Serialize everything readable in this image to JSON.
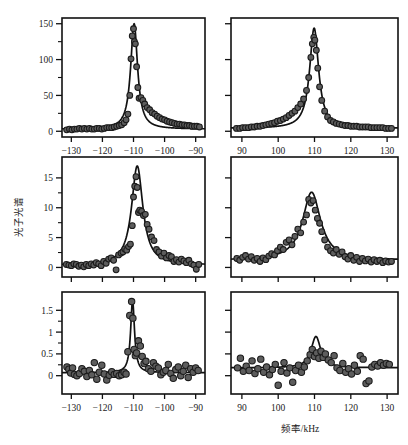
{
  "figure": {
    "title": "",
    "xlabel": "频率/kHz",
    "ylabel": "光子光谱"
  },
  "chart_data": [
    {
      "type": "scatter",
      "panel": "top-left",
      "row": 1,
      "column": 1,
      "title": "",
      "xlabel": "频率/kHz",
      "ylabel": "光子光谱",
      "xlim": [
        -133,
        -87
      ],
      "ylim": [
        -8,
        158
      ],
      "xticks": [
        -130,
        -120,
        -110,
        -100,
        -90
      ],
      "xticklabels": [
        "−130",
        "−120",
        "−110",
        "−100",
        "−90"
      ],
      "yticks": [
        0,
        50,
        100,
        150
      ],
      "yticklabels": [
        "0",
        "50",
        "100",
        "150"
      ],
      "yminorticks": [
        25,
        75,
        125
      ],
      "grid": false,
      "legend": null,
      "series": [
        {
          "name": "data",
          "marker": "filled-circle",
          "color": "#5d5d5d",
          "x": [
            -131.5,
            -130.6,
            -129.8,
            -129.0,
            -128.2,
            -127.4,
            -126.6,
            -125.8,
            -125.0,
            -124.2,
            -123.4,
            -122.6,
            -121.8,
            -121.0,
            -120.2,
            -119.4,
            -118.6,
            -117.8,
            -117.0,
            -116.2,
            -115.4,
            -114.6,
            -113.8,
            -113.0,
            -112.4,
            -111.8,
            -111.2,
            -110.8,
            -110.4,
            -110.0,
            -109.7,
            -109.4,
            -109.0,
            -108.6,
            -108.2,
            -107.6,
            -107.0,
            -106.4,
            -105.6,
            -104.8,
            -104.0,
            -103.2,
            -102.4,
            -101.6,
            -100.8,
            -100.0,
            -99.2,
            -98.4,
            -97.6,
            -96.8,
            -96.0,
            -95.2,
            -94.4,
            -93.6,
            -92.8,
            -92.0,
            -91.2,
            -90.4,
            -89.6,
            -88.8
          ],
          "y": [
            2,
            3,
            2,
            3,
            3,
            4,
            3,
            4,
            3,
            4,
            3,
            3,
            4,
            4,
            3,
            4,
            5,
            5,
            5,
            6,
            7,
            8,
            9,
            12,
            16,
            24,
            50,
            101,
            133,
            143,
            125,
            122,
            90,
            61,
            46,
            47,
            43,
            38,
            33,
            30,
            26,
            24,
            21,
            19,
            17,
            16,
            14,
            13,
            12,
            11,
            10,
            10,
            9,
            9,
            8,
            8,
            7,
            7,
            7,
            6
          ]
        },
        {
          "name": "lorentzian-fit",
          "type": "line",
          "color": "#111111",
          "peak_center": -109.8,
          "peak_height": 147,
          "hwhm": 1.35,
          "baseline": 3.0
        }
      ]
    },
    {
      "type": "scatter",
      "panel": "top-right",
      "row": 1,
      "column": 2,
      "title": "",
      "xlim": [
        87,
        133
      ],
      "ylim": [
        -8,
        158
      ],
      "xticks": [
        90,
        100,
        110,
        120,
        130
      ],
      "xticklabels": [
        "90",
        "100",
        "110",
        "120",
        "130"
      ],
      "yticks": [
        0,
        50,
        100,
        150
      ],
      "grid": false,
      "legend": null,
      "series": [
        {
          "name": "data",
          "marker": "filled-circle",
          "color": "#5d5d5d",
          "x": [
            88.5,
            89.4,
            90.2,
            91.0,
            91.8,
            92.6,
            93.4,
            94.2,
            95.0,
            95.8,
            96.6,
            97.4,
            98.2,
            99.0,
            99.8,
            100.6,
            101.4,
            102.2,
            103.0,
            103.8,
            104.6,
            105.4,
            106.2,
            107.0,
            107.8,
            108.4,
            109.0,
            109.4,
            109.8,
            110.1,
            110.5,
            110.9,
            111.4,
            112.0,
            112.8,
            113.6,
            114.4,
            115.2,
            116.0,
            116.8,
            117.6,
            118.4,
            119.2,
            120.0,
            120.8,
            121.6,
            122.4,
            123.2,
            124.0,
            124.8,
            125.6,
            126.4,
            127.2,
            128.0,
            128.8,
            129.6,
            130.4,
            131.2
          ],
          "y": [
            4,
            4,
            5,
            5,
            5,
            6,
            6,
            7,
            7,
            8,
            9,
            10,
            11,
            12,
            14,
            15,
            17,
            19,
            22,
            25,
            28,
            33,
            38,
            45,
            57,
            75,
            103,
            122,
            131,
            127,
            113,
            88,
            62,
            43,
            28,
            20,
            15,
            13,
            11,
            10,
            9,
            8,
            8,
            7,
            7,
            7,
            6,
            6,
            6,
            6,
            5,
            5,
            5,
            5,
            5,
            4,
            4,
            4
          ]
        },
        {
          "name": "lorentzian-fit",
          "type": "line",
          "color": "#111111",
          "peak_center": 109.9,
          "peak_height": 140,
          "hwhm": 1.5,
          "baseline": 4.0
        }
      ]
    },
    {
      "type": "scatter",
      "panel": "middle-left",
      "row": 2,
      "column": 1,
      "title": "",
      "xlim": [
        -133,
        -87
      ],
      "ylim": [
        -1.6,
        18.5
      ],
      "xticks": [
        -130,
        -120,
        -110,
        -100,
        -90
      ],
      "yticks": [
        0,
        5,
        10,
        15
      ],
      "yticklabels": [
        "0",
        "5",
        "10",
        "15"
      ],
      "yminorticks": [
        2.5,
        7.5,
        12.5
      ],
      "grid": false,
      "legend": null,
      "series": [
        {
          "name": "data",
          "marker": "filled-circle",
          "color": "#5d5d5d",
          "x": [
            -131.6,
            -130.8,
            -130.0,
            -129.2,
            -128.4,
            -127.6,
            -126.8,
            -126.0,
            -125.2,
            -124.4,
            -123.6,
            -122.8,
            -122.0,
            -121.2,
            -120.4,
            -119.6,
            -118.8,
            -118.0,
            -117.2,
            -116.4,
            -115.6,
            -114.8,
            -114.0,
            -113.4,
            -112.8,
            -112.2,
            -111.6,
            -111.0,
            -110.4,
            -110.0,
            -109.6,
            -109.2,
            -108.8,
            -108.4,
            -108.0,
            -107.4,
            -106.8,
            -106.2,
            -105.6,
            -105.0,
            -104.2,
            -103.4,
            -102.6,
            -101.8,
            -101.0,
            -100.2,
            -99.4,
            -98.6,
            -97.8,
            -97.0,
            -96.2,
            -95.4,
            -94.6,
            -93.8,
            -93.0,
            -92.2,
            -91.4,
            -90.6,
            -89.8,
            -89.0
          ],
          "y": [
            0.5,
            0.4,
            0.3,
            0.6,
            0.5,
            0.2,
            0.4,
            0.1,
            0.5,
            0.3,
            0.6,
            0.4,
            0.8,
            0.6,
            0.3,
            1.0,
            0.7,
            1.4,
            1.6,
            1.2,
            -0.4,
            2.1,
            2.4,
            2.6,
            3.1,
            2.9,
            3.5,
            3.9,
            7.0,
            11.8,
            13.6,
            15.2,
            13.4,
            9.2,
            9.6,
            9.4,
            8.7,
            8.9,
            7.2,
            6.4,
            5.1,
            4.5,
            3.0,
            2.6,
            1.9,
            2.4,
            1.6,
            2.0,
            1.8,
            1.0,
            1.3,
            0.9,
            1.4,
            1.1,
            0.8,
            1.2,
            0.6,
            0.4,
            -0.3,
            0.5
          ]
        },
        {
          "name": "lorentzian-fit",
          "type": "line",
          "color": "#111111",
          "peak_center": -108.8,
          "peak_height": 16.6,
          "hwhm": 2.2,
          "baseline": 0.4
        }
      ]
    },
    {
      "type": "scatter",
      "panel": "middle-right",
      "row": 2,
      "column": 2,
      "title": "",
      "xlim": [
        87,
        133
      ],
      "ylim": [
        -1.6,
        18.5
      ],
      "xticks": [
        90,
        100,
        110,
        120,
        130
      ],
      "yticks": [
        0,
        5,
        10,
        15
      ],
      "grid": false,
      "legend": null,
      "series": [
        {
          "name": "data",
          "marker": "filled-circle",
          "color": "#5d5d5d",
          "x": [
            88.6,
            89.4,
            90.2,
            91.0,
            91.8,
            92.6,
            93.4,
            94.2,
            95.0,
            95.8,
            96.6,
            97.4,
            98.2,
            99.0,
            99.8,
            100.6,
            101.4,
            102.2,
            103.0,
            103.8,
            104.6,
            105.4,
            106.2,
            107.0,
            107.8,
            108.4,
            109.0,
            109.6,
            110.2,
            110.8,
            111.4,
            112.0,
            112.8,
            113.6,
            114.4,
            115.2,
            116.0,
            116.8,
            117.6,
            118.4,
            119.2,
            120.0,
            120.8,
            121.6,
            122.4,
            123.2,
            124.0,
            124.8,
            125.6,
            126.4,
            127.2,
            128.0,
            128.8,
            129.6,
            130.4,
            131.2
          ],
          "y": [
            1.5,
            1.2,
            1.7,
            2.0,
            1.4,
            1.8,
            1.2,
            1.5,
            1.0,
            1.6,
            1.3,
            1.9,
            2.3,
            2.1,
            2.8,
            3.4,
            3.0,
            4.2,
            4.6,
            3.8,
            5.2,
            6.4,
            5.8,
            7.6,
            8.8,
            11.4,
            10.8,
            11.2,
            9.6,
            8.2,
            7.4,
            6.0,
            4.6,
            3.4,
            2.8,
            2.4,
            3.0,
            2.2,
            2.6,
            1.8,
            1.4,
            2.0,
            1.2,
            1.7,
            1.0,
            1.5,
            1.1,
            1.4,
            0.9,
            1.3,
            1.0,
            1.2,
            0.8,
            1.1,
            0.9,
            1.0
          ]
        },
        {
          "name": "lorentzian-fit",
          "type": "line",
          "color": "#111111",
          "peak_center": 109.2,
          "peak_height": 11.4,
          "hwhm": 3.0,
          "baseline": 1.2
        }
      ]
    },
    {
      "type": "scatter",
      "panel": "bottom-left",
      "row": 3,
      "column": 1,
      "title": "",
      "xlim": [
        -133,
        -87
      ],
      "ylim": [
        -0.42,
        1.92
      ],
      "xticks": [
        -130,
        -120,
        -110,
        -100,
        -90
      ],
      "xticklabels": [
        "−130",
        "−120",
        "−110",
        "−100",
        "−90"
      ],
      "yticks": [
        0,
        0.5,
        1,
        1.5
      ],
      "yticklabels": [
        "0",
        "0.5",
        "1",
        "1.5"
      ],
      "yminorticks": [
        0.25,
        0.75,
        1.25
      ],
      "grid": false,
      "legend": null,
      "series": [
        {
          "name": "data",
          "marker": "filled-circle",
          "color": "#5d5d5d",
          "x": [
            -131.4,
            -130.8,
            -130.2,
            -129.6,
            -129.0,
            -128.2,
            -127.4,
            -126.6,
            -125.8,
            -125.0,
            -124.2,
            -123.4,
            -122.6,
            -121.8,
            -121.0,
            -120.2,
            -119.4,
            -118.6,
            -117.8,
            -117.0,
            -116.2,
            -115.4,
            -114.6,
            -113.8,
            -113.0,
            -112.4,
            -111.8,
            -111.2,
            -110.6,
            -110.2,
            -109.8,
            -109.4,
            -109.0,
            -108.4,
            -107.8,
            -107.2,
            -106.6,
            -106.0,
            -105.2,
            -104.4,
            -103.6,
            -102.8,
            -102.0,
            -101.2,
            -100.4,
            -99.6,
            -98.8,
            -98.0,
            -97.2,
            -96.4,
            -95.6,
            -94.8,
            -94.0,
            -93.2,
            -92.4,
            -91.6,
            -90.8,
            -90.0,
            -89.2
          ],
          "y": [
            0.2,
            0.15,
            0.06,
            0.18,
            0.03,
            0.0,
            0.05,
            0.16,
            0.1,
            -0.02,
            0.12,
            0.02,
            0.3,
            -0.08,
            0.08,
            0.24,
            0.04,
            -0.1,
            0.01,
            0.09,
            0.03,
            0.05,
            0.0,
            0.02,
            0.08,
            0.04,
            0.55,
            1.38,
            1.7,
            1.32,
            0.6,
            0.46,
            0.52,
            0.8,
            0.68,
            0.44,
            0.28,
            0.33,
            0.16,
            0.1,
            0.3,
            0.22,
            0.18,
            0.02,
            0.08,
            0.12,
            0.26,
            0.05,
            -0.06,
            0.14,
            0.2,
            0.0,
            0.1,
            0.24,
            -0.04,
            0.16,
            0.08,
            0.18,
            0.12
          ]
        },
        {
          "name": "lorentzian-fit",
          "type": "line",
          "color": "#111111",
          "peak_center": -110.3,
          "peak_height": 1.66,
          "hwhm": 0.75,
          "baseline": 0.07
        }
      ]
    },
    {
      "type": "scatter",
      "panel": "bottom-right",
      "row": 3,
      "column": 2,
      "title": "",
      "xlim": [
        87,
        133
      ],
      "ylim": [
        -0.42,
        1.92
      ],
      "xticks": [
        90,
        100,
        110,
        120,
        130
      ],
      "xticklabels": [
        "90",
        "100",
        "110",
        "120",
        "130"
      ],
      "yticks": [
        0,
        0.5,
        1,
        1.5
      ],
      "grid": false,
      "legend": null,
      "series": [
        {
          "name": "data",
          "marker": "filled-circle",
          "color": "#5d5d5d",
          "x": [
            88.8,
            89.6,
            90.4,
            91.2,
            92.0,
            92.8,
            93.6,
            94.4,
            95.2,
            96.0,
            96.8,
            97.6,
            98.4,
            99.2,
            100.0,
            100.8,
            101.6,
            102.4,
            103.2,
            104.0,
            104.8,
            105.6,
            106.4,
            107.2,
            108.0,
            108.8,
            109.4,
            110.0,
            110.6,
            111.2,
            111.8,
            112.4,
            113.0,
            113.8,
            114.6,
            115.4,
            116.2,
            117.0,
            117.8,
            118.6,
            119.4,
            120.2,
            121.0,
            121.8,
            122.6,
            123.4,
            124.2,
            125.0,
            125.8,
            126.6,
            127.4,
            128.2,
            129.0,
            129.8,
            130.6
          ],
          "y": [
            0.18,
            0.4,
            0.1,
            0.22,
            0.12,
            0.34,
            0.05,
            0.16,
            0.38,
            0.08,
            0.2,
            0.02,
            0.14,
            0.26,
            -0.22,
            0.1,
            0.3,
            0.06,
            0.18,
            -0.15,
            0.12,
            0.24,
            0.08,
            0.2,
            0.34,
            0.48,
            0.6,
            0.44,
            0.52,
            0.4,
            0.56,
            0.42,
            0.5,
            0.36,
            0.3,
            0.46,
            0.18,
            0.12,
            0.28,
            0.08,
            0.16,
            0.04,
            0.24,
            0.1,
            0.46,
            0.38,
            -0.18,
            -0.12,
            0.2,
            0.26,
            0.22,
            0.3,
            0.24,
            0.28,
            0.26
          ]
        },
        {
          "name": "lorentzian-fit",
          "type": "line",
          "color": "#111111",
          "peak_center": 110.4,
          "peak_height": 0.72,
          "hwhm": 1.6,
          "baseline": 0.18
        }
      ]
    }
  ]
}
